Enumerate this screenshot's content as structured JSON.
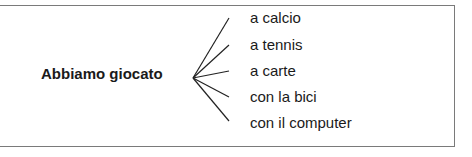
{
  "diagram": {
    "stem": "Abbiamo giocato",
    "branches": [
      {
        "label": "a calcio"
      },
      {
        "label": "a tennis"
      },
      {
        "label": "a carte"
      },
      {
        "label": "con la bici"
      },
      {
        "label": "con il computer"
      }
    ],
    "colors": {
      "border": "#7a7a7a",
      "lines": "#222222",
      "text": "#1a1a1a"
    }
  }
}
